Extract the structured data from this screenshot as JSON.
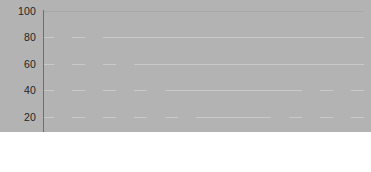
{
  "chart_data": {
    "type": "bar",
    "title": "",
    "subtitle": "",
    "xlabel": "",
    "ylabel": "",
    "categories": [
      "1996",
      "1997",
      "1998",
      "1999",
      "2000",
      "2001",
      "2002",
      "2003",
      "2004",
      "2005"
    ],
    "values": [
      100,
      91,
      80,
      71,
      46,
      32,
      2,
      17,
      27,
      41
    ],
    "ylim": [
      0,
      100
    ],
    "y_ticks": [
      "0",
      "20",
      "40",
      "60",
      "80",
      "100"
    ],
    "y_tick_values": [
      0,
      20,
      40,
      60,
      80,
      100
    ],
    "x_tick_labels": [
      "1997",
      "1999",
      "2001",
      "2003",
      "2005"
    ],
    "x_tick_category_index": [
      1,
      3,
      5,
      7,
      9
    ],
    "grid": true,
    "grid_orientation": "horizontal",
    "legend": false,
    "legend_position": "none",
    "series": [
      {
        "name": "series-1",
        "color": "#b3b3b3",
        "values": [
          100,
          91,
          80,
          71,
          46,
          32,
          2,
          17,
          27,
          41
        ]
      }
    ],
    "colors": {
      "bar": "#b3b3b3",
      "gridline": "#c9c9c9",
      "axis": "#6e6e6e",
      "tick_text": "#242424",
      "background": "#ffffff"
    }
  }
}
